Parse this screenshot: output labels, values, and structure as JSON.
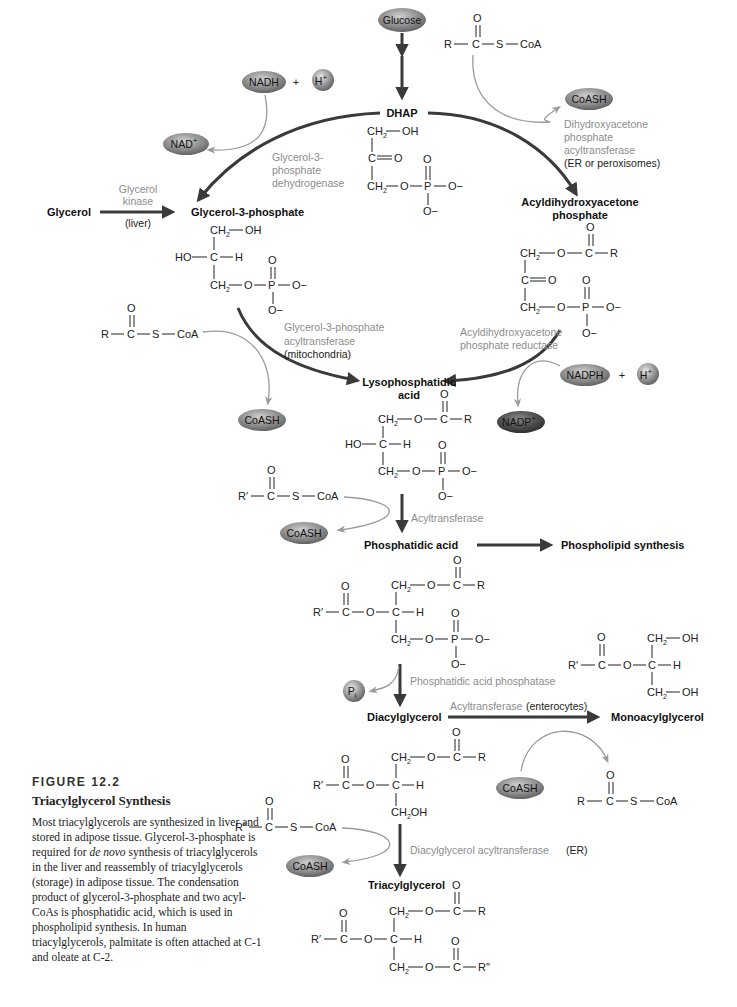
{
  "figure": {
    "number": "FIGURE 12.2",
    "title": "Triacylglycerol Synthesis",
    "caption_parts": [
      "Most triacylglycerols are synthesized in liver and stored in adipose tissue. Glycerol-3-phosphate is required for ",
      "de novo",
      " synthesis of triacylglycerols in the liver and reassembly of triacylglycerols (storage) in adipose tissue. The condensation product of glycerol-3-phosphate and two acyl-CoAs is phosphatidic acid, which is used in phospholipid synthesis. In human triacylglycerols, palmitate is often attached at C-1 and oleate at C-2."
    ]
  },
  "metabolites": {
    "glucose": "Glucose",
    "dhap": "DHAP",
    "glycerol": "Glycerol",
    "glycerol3p": "Glycerol-3-phosphate",
    "acyl_dhap_1": "Acyldihydroxyacetone",
    "acyl_dhap_2": "phosphate",
    "lpa_1": "Lysophosphatidic",
    "lpa_2": "acid",
    "pa": "Phosphatidic acid",
    "phospholipid": "Phospholipid synthesis",
    "dag": "Diacylglycerol",
    "mag": "Monoacylglycerol",
    "tag": "Triacylglycerol"
  },
  "cofactors": {
    "nadh": "NADH",
    "h": "H",
    "h_sup": "+",
    "nad": "NAD",
    "nad_sup": "+",
    "plus": "+",
    "nadph": "NADPH",
    "nadp": "NADP",
    "nadp_sup": "+",
    "coash": "CoASH",
    "pi": "P",
    "pi_sub": "i"
  },
  "enzymes": {
    "g3pdh": [
      "Glycerol-3-",
      "phosphate",
      "dehydrogenase"
    ],
    "glycerol_kinase": [
      "Glycerol",
      "kinase"
    ],
    "glycerol_kinase_loc": "(liver)",
    "dhapat": [
      "Dihydroxyacetone",
      "phosphate",
      "acyltransferase"
    ],
    "dhapat_loc": "(ER or peroxisomes)",
    "gpat": [
      "Glycerol-3-phosphate",
      "acyltransferase"
    ],
    "gpat_loc": "(mitochondria)",
    "adhapr": [
      "Acyldihydroxyacetone",
      "phosphate reductase"
    ],
    "acyltransferase": "Acyltransferase",
    "pap": "Phosphatidic acid phosphatase",
    "mag_acyltransferase": "Acyltransferase",
    "mag_loc": "(enterocytes)",
    "dgat": "Diacylglycerol acyltransferase",
    "dgat_loc": "(ER)"
  },
  "atoms": {
    "ch2": "CH",
    "two": "2",
    "oh": "OH",
    "o": "O",
    "c": "C",
    "p": "P",
    "h": "H",
    "ho": "HO",
    "ominus": "O−",
    "r": "R",
    "r1": "R′",
    "r2": "R″",
    "s": "S",
    "coa": "CoA",
    "ch2oh": "CH",
    "eq": "="
  },
  "colors": {
    "main_arrow": "#3a3a3a",
    "side_arrow": "#9a9a9a",
    "enzyme_text": "#8c8c8c",
    "pill_fill": "#8e8e8e",
    "pill_dark": "#4f4f4f"
  }
}
